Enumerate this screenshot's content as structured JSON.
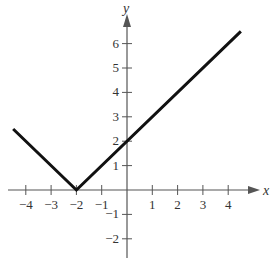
{
  "chart_data": {
    "type": "line",
    "title": "",
    "function": "y = |x + 2|",
    "xlabel": "x",
    "ylabel": "y",
    "xlim": [
      -4.5,
      4.7
    ],
    "ylim": [
      -2.5,
      7
    ],
    "grid": false,
    "x_ticks": [
      -4,
      -3,
      -2,
      -1,
      1,
      2,
      3,
      4
    ],
    "y_ticks": [
      -2,
      -1,
      1,
      2,
      3,
      4,
      5,
      6
    ],
    "x_tick_labels": [
      "−4",
      "−3",
      "−2",
      "−1",
      "1",
      "2",
      "3",
      "4"
    ],
    "y_tick_labels": [
      "−2",
      "−1",
      "1",
      "2",
      "3",
      "4",
      "5",
      "6"
    ],
    "series": [
      {
        "name": "y = |x + 2|",
        "x": [
          -4.5,
          -2,
          4.5
        ],
        "y": [
          2.5,
          0,
          6.5
        ]
      }
    ]
  },
  "axes": {
    "x_label": "x",
    "y_label": "y"
  }
}
